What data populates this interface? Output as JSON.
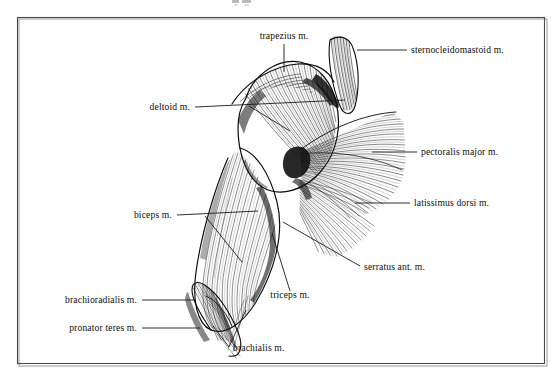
{
  "figure": {
    "kind": "anatomical-illustration",
    "style": "line engraving, black ink on white",
    "background_color": "#ffffff",
    "ink_color": "#111111",
    "frame_color": "#4a4a4a",
    "top_edge_fragment": "",
    "canvas": {
      "width": 559,
      "height": 380
    },
    "frame": {
      "x": 17,
      "y": 17,
      "width": 528,
      "height": 347
    }
  },
  "labels": [
    {
      "id": "trapezius",
      "text": "trapezius m.",
      "anchor": "middle",
      "text_x": 284,
      "text_y": 39,
      "leader": "M 284 44 L 284 72",
      "side": "top"
    },
    {
      "id": "sternocleidomastoid",
      "text": "sternocleidomastoid m.",
      "anchor": "start",
      "text_x": 411,
      "text_y": 53,
      "leader": "M 407 50 L 357 50",
      "side": "right"
    },
    {
      "id": "deltoid",
      "text": "deltoid m.",
      "anchor": "end",
      "text_x": 190,
      "text_y": 110,
      "leader": "M 195 107 L 345 100 M 249 106 L 290 131",
      "side": "left"
    },
    {
      "id": "pectoralis_major",
      "text": "pectoralis major m.",
      "anchor": "start",
      "text_x": 421,
      "text_y": 155,
      "leader": "M 417 152 L 372 152",
      "side": "right"
    },
    {
      "id": "latissimus_dorsi",
      "text": "latissimus dorsi m.",
      "anchor": "start",
      "text_x": 414,
      "text_y": 206,
      "leader": "M 410 203 L 355 203",
      "side": "right"
    },
    {
      "id": "biceps",
      "text": "biceps m.",
      "anchor": "end",
      "text_x": 172,
      "text_y": 218,
      "leader": "M 177 215 L 258 211 M 205 216 L 242 262",
      "side": "left"
    },
    {
      "id": "serratus_anterior",
      "text": "serratus ant. m.",
      "anchor": "start",
      "text_x": 364,
      "text_y": 270,
      "leader": "M 360 266 L 283 222",
      "side": "right"
    },
    {
      "id": "triceps",
      "text": "triceps m.",
      "anchor": "middle",
      "text_x": 290,
      "text_y": 298,
      "leader": "M 290 291 L 272 233",
      "side": "bottom"
    },
    {
      "id": "brachioradialis",
      "text": "brachioradialis m.",
      "anchor": "end",
      "text_x": 137,
      "text_y": 303,
      "leader": "M 142 300 L 196 300",
      "side": "left"
    },
    {
      "id": "pronator_teres",
      "text": "pronator teres m.",
      "anchor": "end",
      "text_x": 137,
      "text_y": 331,
      "leader": "M 142 328 L 200 328",
      "side": "left"
    },
    {
      "id": "brachialis",
      "text": "brachialis m.",
      "anchor": "start",
      "text_x": 233,
      "text_y": 351,
      "leader": "M 229 347 L 213 326 M 229 347 L 246 310",
      "side": "bottom"
    }
  ]
}
